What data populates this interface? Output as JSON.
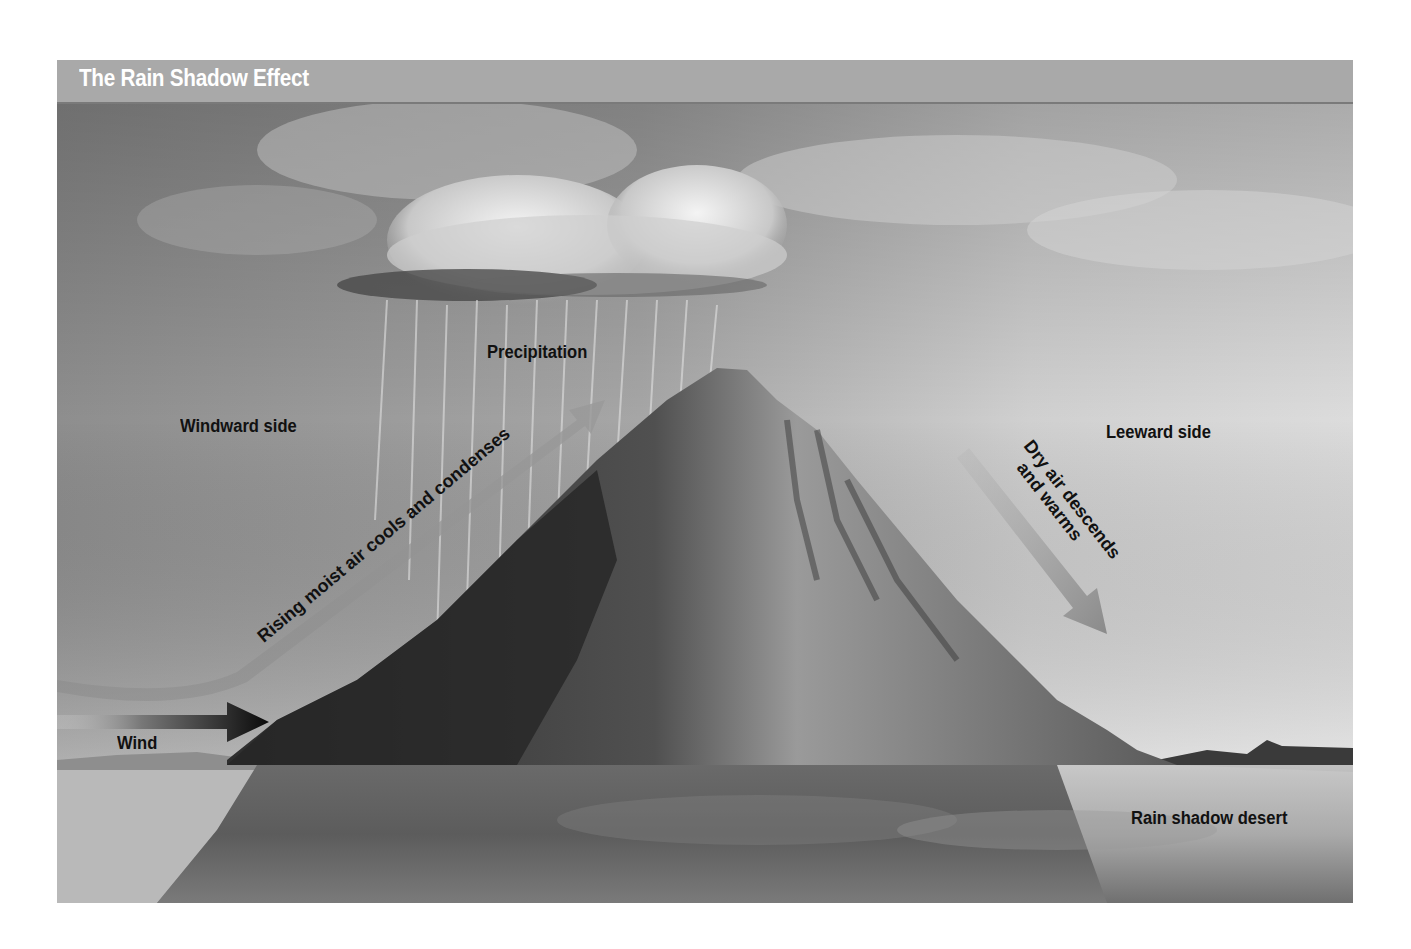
{
  "title": "The Rain Shadow Effect",
  "labels": {
    "precipitation": "Precipitation",
    "windward_side": "Windward side",
    "leeward_side": "Leeward side",
    "rising_air": "Rising moist air cools and condenses",
    "dry_air_line1": "Dry air descends",
    "dry_air_line2": "and warms",
    "wind": "Wind",
    "rain_shadow_desert": "Rain shadow desert"
  },
  "colors": {
    "title_bar": "#a9a9a9",
    "title_text": "#ffffff",
    "label_text": "#111111",
    "arrow_gray": "#8a8a8a",
    "wind_arrow": "#111111"
  },
  "icons": {
    "wind_arrow": "arrow-right-icon",
    "rising_arrow": "curved-arrow-up-right-icon",
    "descending_arrow": "arrow-down-right-icon"
  }
}
